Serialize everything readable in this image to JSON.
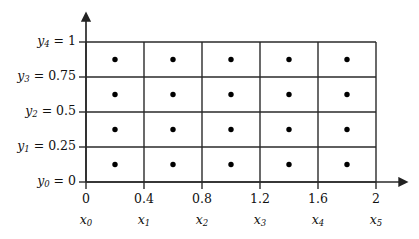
{
  "chart_data": {
    "type": "scatter",
    "title": "",
    "xlabel": "",
    "ylabel": "",
    "grid": true,
    "legend": null,
    "xlim": [
      0,
      2
    ],
    "ylim": [
      0,
      1
    ],
    "x_gridlines": [
      0,
      0.4,
      0.8,
      1.2,
      1.6,
      2
    ],
    "y_gridlines": [
      0,
      0.25,
      0.5,
      0.75,
      1
    ],
    "x_tick_labels": [
      "0",
      "0.4",
      "0.8",
      "1.2",
      "1.6",
      "2"
    ],
    "x_tick_symbols": [
      "x₀",
      "x₁",
      "x₂",
      "x₃",
      "x₄",
      "x₅"
    ],
    "y_tick_labels": [
      "y₀ = 0",
      "y₁ = 0.25",
      "y₂ = 0.5",
      "y₃ = 0.75",
      "y₄ = 1"
    ],
    "points_x": [
      0.2,
      0.6,
      1.0,
      1.4,
      1.8
    ],
    "points_y": [
      0.125,
      0.375,
      0.625,
      0.875
    ],
    "points": [
      [
        0.2,
        0.125
      ],
      [
        0.6,
        0.125
      ],
      [
        1.0,
        0.125
      ],
      [
        1.4,
        0.125
      ],
      [
        1.8,
        0.125
      ],
      [
        0.2,
        0.375
      ],
      [
        0.6,
        0.375
      ],
      [
        1.0,
        0.375
      ],
      [
        1.4,
        0.375
      ],
      [
        1.8,
        0.375
      ],
      [
        0.2,
        0.625
      ],
      [
        0.6,
        0.625
      ],
      [
        1.0,
        0.625
      ],
      [
        1.4,
        0.625
      ],
      [
        1.8,
        0.625
      ],
      [
        0.2,
        0.875
      ],
      [
        0.6,
        0.875
      ],
      [
        1.0,
        0.875
      ],
      [
        1.4,
        0.875
      ],
      [
        1.8,
        0.875
      ]
    ],
    "point_count": 20,
    "grid_columns": 5,
    "grid_rows": 4,
    "colors": {
      "line": "#222222",
      "point": "#000000",
      "background": "#ffffff"
    }
  },
  "y_axis": {
    "labels": [
      {
        "sym": "y",
        "sub": "0",
        "eq": " = ",
        "val": "0"
      },
      {
        "sym": "y",
        "sub": "1",
        "eq": " = ",
        "val": "0.25"
      },
      {
        "sym": "y",
        "sub": "2",
        "eq": " = ",
        "val": "0.5"
      },
      {
        "sym": "y",
        "sub": "3",
        "eq": " = ",
        "val": "0.75"
      },
      {
        "sym": "y",
        "sub": "4",
        "eq": " = ",
        "val": "1"
      }
    ]
  },
  "x_axis": {
    "numbers": [
      "0",
      "0.4",
      "0.8",
      "1.2",
      "1.6",
      "2"
    ],
    "symbols": [
      {
        "sym": "x",
        "sub": "0"
      },
      {
        "sym": "x",
        "sub": "1"
      },
      {
        "sym": "x",
        "sub": "2"
      },
      {
        "sym": "x",
        "sub": "3"
      },
      {
        "sym": "x",
        "sub": "4"
      },
      {
        "sym": "x",
        "sub": "5"
      }
    ]
  }
}
